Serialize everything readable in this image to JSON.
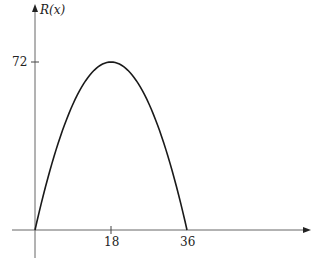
{
  "chart_data": {
    "type": "line",
    "title": "",
    "xlabel": "",
    "ylabel": "R(x)",
    "function": "R(x) = 8x - (2/9)x^2 (parabola through (0,0), (18,72), (36,0))",
    "x": [
      0,
      3,
      6,
      9,
      12,
      15,
      18,
      21,
      24,
      27,
      30,
      33,
      36
    ],
    "series": [
      {
        "name": "R(x)",
        "values": [
          0,
          22,
          40,
          54,
          64,
          70,
          72,
          70,
          64,
          54,
          40,
          22,
          0
        ]
      }
    ],
    "x_ticks": [
      "18",
      "36"
    ],
    "y_ticks": [
      "72"
    ],
    "xlim": [
      -4,
      54
    ],
    "ylim": [
      -6,
      82
    ],
    "grid": false,
    "legend": null,
    "colors": {
      "curve": "#1a1a1a",
      "axis": "#555555"
    }
  },
  "labels": {
    "ylabel": "R(x)",
    "ytick_72": "72",
    "xtick_18": "18",
    "xtick_36": "36"
  }
}
